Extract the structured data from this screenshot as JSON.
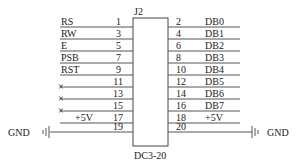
{
  "connector": {
    "designator": "J2",
    "part": "DC3-20",
    "left_pins": [
      {
        "pin": "1",
        "signal": "RS",
        "nc": false
      },
      {
        "pin": "3",
        "signal": "RW",
        "nc": false
      },
      {
        "pin": "5",
        "signal": "E",
        "nc": false
      },
      {
        "pin": "7",
        "signal": "PSB",
        "nc": false
      },
      {
        "pin": "9",
        "signal": "RST",
        "nc": false
      },
      {
        "pin": "11",
        "signal": "",
        "nc": true
      },
      {
        "pin": "13",
        "signal": "",
        "nc": true
      },
      {
        "pin": "15",
        "signal": "",
        "nc": true
      },
      {
        "pin": "17",
        "signal": "+5V",
        "nc": false
      },
      {
        "pin": "19",
        "signal": "",
        "nc": false
      }
    ],
    "right_pins": [
      {
        "pin": "2",
        "signal": "DB0"
      },
      {
        "pin": "4",
        "signal": "DB1"
      },
      {
        "pin": "6",
        "signal": "DB2"
      },
      {
        "pin": "8",
        "signal": "DB3"
      },
      {
        "pin": "10",
        "signal": "DB4"
      },
      {
        "pin": "12",
        "signal": "DB5"
      },
      {
        "pin": "14",
        "signal": "DB6"
      },
      {
        "pin": "16",
        "signal": "DB7"
      },
      {
        "pin": "18",
        "signal": "+5V"
      },
      {
        "pin": "20",
        "signal": ""
      }
    ]
  },
  "ground": {
    "left_label": "GND",
    "right_label": "GND"
  },
  "nc_mark": "×"
}
